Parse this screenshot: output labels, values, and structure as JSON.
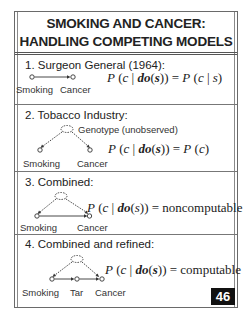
{
  "slide": {
    "title_line1": "SMOKING AND CANCER:",
    "title_line2": "HANDLING COMPETING MODELS",
    "page_number": "46"
  },
  "sections": [
    {
      "label": "1.  Surgeon General (1964):",
      "nodes": [
        "Smoking",
        "Cancer"
      ],
      "formula": {
        "lhs": "P (c | do(s)) =",
        "rhs": "P (c | s)"
      }
    },
    {
      "label": "2.  Tobacco Industry:",
      "latent_label": "Genotype (unobserved)",
      "nodes": [
        "Smoking",
        "Cancer"
      ],
      "formula": {
        "lhs": "P (c | do(s)) =",
        "rhs": "P (c)"
      }
    },
    {
      "label": "3.  Combined:",
      "nodes": [
        "Smoking",
        "Cancer"
      ],
      "formula": {
        "lhs": "P (c | do(s)) =",
        "rhs": "noncomputable"
      }
    },
    {
      "label": "4.  Combined and refined:",
      "nodes": [
        "Smoking",
        "Tar",
        "Cancer"
      ],
      "formula": {
        "lhs": "P (c | do(s)) =",
        "rhs": "computable"
      }
    }
  ],
  "colors": {
    "border": "#6a6a6a",
    "text": "#222222",
    "page_badge_bg": "#111111",
    "page_badge_fg": "#ffffff"
  }
}
